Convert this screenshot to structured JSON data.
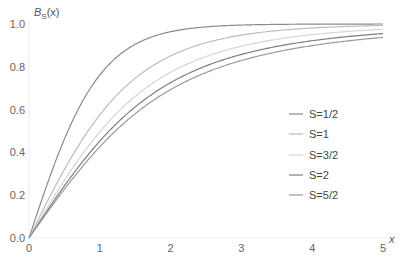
{
  "chart_data": {
    "type": "line",
    "title": "",
    "xlabel": "x",
    "ylabel": "B_S(x)",
    "ylabel_main": "B",
    "ylabel_sub": "S",
    "ylabel_rest": "(x)",
    "xlim": [
      0,
      5
    ],
    "ylim": [
      0,
      1.0
    ],
    "grid": false,
    "legend_position": "right-center",
    "x_ticks": [
      0,
      1,
      2,
      3,
      4,
      5
    ],
    "x_tick_labels": [
      "0",
      "1",
      "2",
      "3",
      "4",
      "5"
    ],
    "y_ticks": [
      0.0,
      0.2,
      0.4,
      0.6,
      0.8,
      1.0
    ],
    "y_tick_labels": [
      "0.0",
      "0.2",
      "0.4",
      "0.6",
      "0.8",
      "1.0"
    ],
    "x": [
      0,
      1,
      2,
      3,
      4,
      5
    ],
    "series": [
      {
        "name": "S=1/2",
        "S": 0.5,
        "color": "#8a8a8a",
        "values": [
          0.0,
          0.762,
          0.964,
          0.995,
          0.999,
          1.0
        ]
      },
      {
        "name": "S=1",
        "S": 1.0,
        "color": "#bdbdbd",
        "values": [
          0.0,
          0.575,
          0.851,
          0.948,
          0.982,
          0.993
        ]
      },
      {
        "name": "S=3/2",
        "S": 1.5,
        "color": "#d6d6d6",
        "values": [
          0.0,
          0.49,
          0.779,
          0.896,
          0.952,
          0.976
        ]
      },
      {
        "name": "S=2",
        "S": 2.0,
        "color": "#7e7e7e",
        "values": [
          0.0,
          0.453,
          0.726,
          0.857,
          0.922,
          0.955
        ]
      },
      {
        "name": "S=5/2",
        "S": 2.5,
        "color": "#9a9a9a",
        "values": [
          0.0,
          0.432,
          0.695,
          0.829,
          0.9,
          0.937
        ]
      }
    ]
  }
}
